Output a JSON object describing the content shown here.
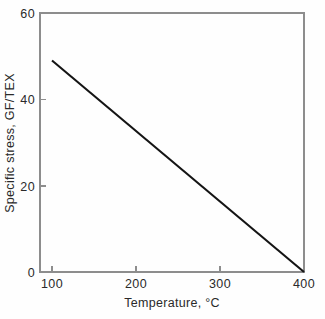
{
  "chart_data": {
    "type": "line",
    "title": "",
    "subtitle": "",
    "xlabel": "Temperature, °C",
    "ylabel": "Specific stress, GF/TEX",
    "xlim": [
      75,
      400
    ],
    "ylim": [
      0,
      60
    ],
    "xticks": [
      100,
      200,
      300,
      400
    ],
    "xticklabels": [
      "100",
      "200",
      "300",
      "400"
    ],
    "yticks": [
      0,
      20,
      40,
      60
    ],
    "yticklabels": [
      "0",
      "20",
      "40",
      "60"
    ],
    "grid": false,
    "legend": false,
    "legend_position": "none",
    "frame": "box",
    "tick_direction": "in",
    "series": [
      {
        "name": "specific stress vs temperature",
        "color": "#141414",
        "x": [
          100,
          400
        ],
        "y": [
          49,
          0
        ]
      }
    ],
    "annotations": []
  },
  "figure": {
    "background_color": "#fefefe",
    "axis_color": "#8d8d8d",
    "text_color": "#2a2a2a",
    "line_color": "#141414"
  }
}
